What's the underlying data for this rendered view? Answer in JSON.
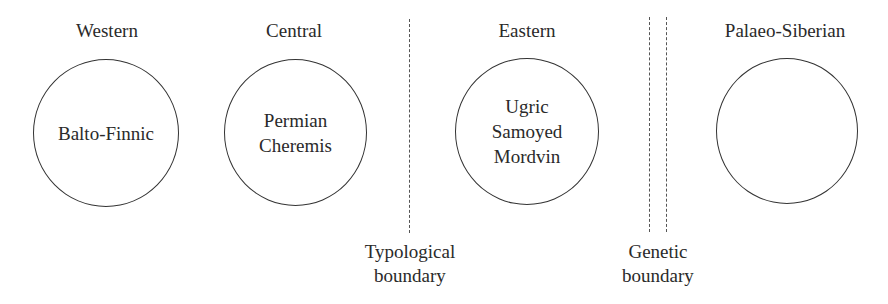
{
  "regions": [
    {
      "heading": "Western",
      "lines": [
        "Balto-Finnic"
      ]
    },
    {
      "heading": "Central",
      "lines": [
        "Permian",
        "Cheremis"
      ]
    },
    {
      "heading": "Eastern",
      "lines": [
        "Ugric",
        "Samoyed",
        "Mordvin"
      ]
    },
    {
      "heading": "Palaeo-Siberian",
      "lines": []
    }
  ],
  "boundaries": {
    "typological": {
      "lines": [
        "Typological",
        "boundary"
      ],
      "style": "single dotted line"
    },
    "genetic": {
      "lines": [
        "Genetic",
        "boundary"
      ],
      "style": "double dotted line"
    }
  },
  "colors": {
    "stroke": "#333333",
    "text": "#2a2a2a",
    "boundary": "#555555"
  }
}
